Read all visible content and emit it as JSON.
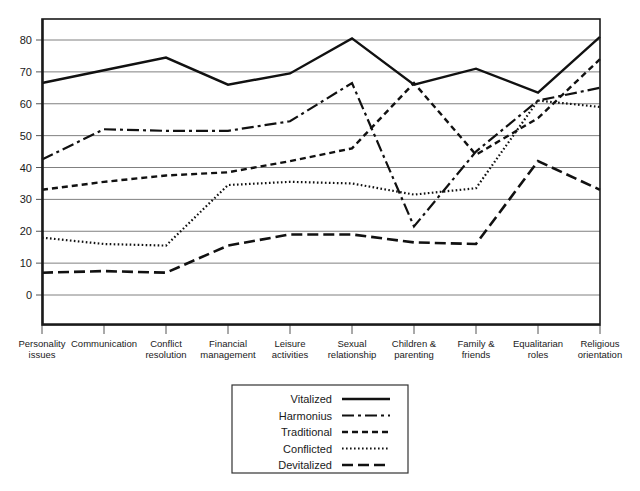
{
  "chart_data": {
    "type": "line",
    "title": "",
    "xlabel": "",
    "ylabel": "",
    "ylim": [
      0,
      85
    ],
    "yticks": [
      0,
      10,
      20,
      30,
      40,
      50,
      60,
      70,
      80
    ],
    "grid": true,
    "legend_position": "bottom-center",
    "categories": [
      "Personality issues",
      "Communication",
      "Conflict resolution",
      "Financial management",
      "Leisure activities",
      "Sexual relationship",
      "Children & parenting",
      "Family & friends",
      "Equalitarian roles",
      "Religious orientation"
    ],
    "category_lines": [
      [
        "Personality",
        "issues"
      ],
      [
        "Communication"
      ],
      [
        "Conflict",
        "resolution"
      ],
      [
        "Financial",
        "management"
      ],
      [
        "Leisure",
        "activities"
      ],
      [
        "Sexual",
        "relationship"
      ],
      [
        "Children &",
        "parenting"
      ],
      [
        "Family &",
        "friends"
      ],
      [
        "Equalitarian",
        "roles"
      ],
      [
        "Religious",
        "orientation"
      ]
    ],
    "series": [
      {
        "name": "Vitalized",
        "style": "solid",
        "dash": "none",
        "width": 2.4,
        "values": [
          66.5,
          70.5,
          74.5,
          66,
          69.5,
          80.5,
          66,
          71,
          63.5,
          81
        ]
      },
      {
        "name": "Harmonius",
        "style": "dash-dot",
        "dash": "12,4,3,4",
        "width": 2.2,
        "values": [
          42.5,
          52,
          51.5,
          51.5,
          54.5,
          66.5,
          21.5,
          45,
          61,
          65
        ]
      },
      {
        "name": "Traditional",
        "style": "dashed",
        "dash": "6,4",
        "width": 2.4,
        "values": [
          33,
          35.5,
          37.5,
          38.5,
          42,
          46,
          66.5,
          44,
          55.5,
          74
        ]
      },
      {
        "name": "Conflicted",
        "style": "dotted",
        "dash": "1.6,2.4",
        "width": 2.2,
        "values": [
          18,
          16,
          15.5,
          34.5,
          35.5,
          35,
          31.5,
          33.5,
          61,
          59
        ]
      },
      {
        "name": "Devitalized",
        "style": "long-dash",
        "dash": "11,5",
        "width": 2.6,
        "values": [
          7,
          7.5,
          7,
          15.5,
          19,
          19,
          16.5,
          16,
          42,
          33
        ]
      }
    ],
    "legend": [
      {
        "label": "Vitalized",
        "dash": "none",
        "width": 2.4
      },
      {
        "label": "Harmonius",
        "dash": "12,4,3,4",
        "width": 2.2
      },
      {
        "label": "Traditional",
        "dash": "6,4",
        "width": 2.4
      },
      {
        "label": "Conflicted",
        "dash": "1.6,2.4",
        "width": 2.2
      },
      {
        "label": "Devitalized",
        "dash": "11,5",
        "width": 2.6
      }
    ],
    "colors": {
      "line": "#111111",
      "grid": "#808080",
      "frame": "#1a1a1a",
      "background": "#ffffff",
      "text": "#1a1a1a"
    }
  }
}
